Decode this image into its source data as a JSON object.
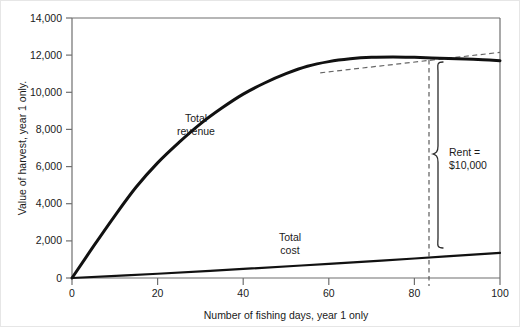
{
  "chart_data": {
    "type": "line",
    "title": "",
    "xlabel": "Number of fishing days, year 1 only",
    "ylabel": "Value of harvest, year 1 only.",
    "xlim": [
      0,
      100
    ],
    "ylim": [
      0,
      14000
    ],
    "xticks": [
      "0",
      "20",
      "40",
      "60",
      "80",
      "100"
    ],
    "xtick_values": [
      0,
      20,
      40,
      60,
      80,
      100
    ],
    "yticks": [
      "0",
      "2,000",
      "4,000",
      "6,000",
      "8,000",
      "10,000",
      "12,000",
      "14,000"
    ],
    "ytick_values": [
      0,
      2000,
      4000,
      6000,
      8000,
      10000,
      12000,
      14000
    ],
    "grid": false,
    "legend": "inline-labels",
    "series": [
      {
        "name": "Total revenue",
        "label": "Total revenue",
        "label_line1": "Total",
        "label_line2": "revenue",
        "color": "#111111",
        "style": "solid",
        "width": 3,
        "x": [
          0,
          5,
          10,
          15,
          20,
          25,
          30,
          35,
          40,
          45,
          50,
          55,
          60,
          65,
          70,
          75,
          80,
          84,
          88,
          92,
          96,
          100
        ],
        "values": [
          0,
          1700,
          3350,
          4900,
          6200,
          7300,
          8300,
          9150,
          9900,
          10500,
          11000,
          11400,
          11650,
          11800,
          11880,
          11900,
          11880,
          11850,
          11820,
          11790,
          11750,
          11700
        ]
      },
      {
        "name": "Total cost",
        "label": "Total cost",
        "label_line1": "Total",
        "label_line2": "cost",
        "color": "#111111",
        "style": "solid",
        "width": 2.2,
        "x": [
          0,
          20,
          40,
          60,
          80,
          100
        ],
        "values": [
          0,
          230,
          490,
          760,
          1050,
          1350
        ]
      },
      {
        "name": "Tangent to total revenue",
        "label": "",
        "color": "#555555",
        "style": "dashed",
        "width": 1.2,
        "x": [
          58,
          100
        ],
        "values": [
          11050,
          12150
        ]
      }
    ],
    "annotations": [
      {
        "name": "rent-bracket",
        "label_line1": "Rent =",
        "label_line2": "$10,000",
        "label": "Rent = $10,000",
        "value": 10000,
        "at_x": 84,
        "top_value": 11850,
        "bottom_value": 1600
      },
      {
        "name": "optimum-days-marker",
        "label": "",
        "at_x": 84,
        "style": "dashed-vertical"
      }
    ]
  }
}
